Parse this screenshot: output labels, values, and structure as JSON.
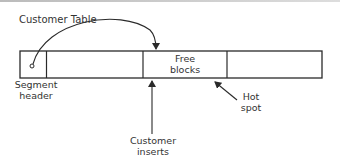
{
  "diagram": {
    "title": "Customer Table",
    "cells": [
      {
        "id": "segment-header",
        "label": "",
        "has_marker": true
      },
      {
        "id": "block-1",
        "label": ""
      },
      {
        "id": "free-blocks",
        "label_line1": "Free",
        "label_line2": "blocks"
      },
      {
        "id": "block-3",
        "label": ""
      }
    ],
    "labels": {
      "segment_header_line1": "Segment",
      "segment_header_line2": "header",
      "customer_inserts_line1": "Customer",
      "customer_inserts_line2": "inserts",
      "hot_spot_line1": "Hot",
      "hot_spot_line2": "spot"
    },
    "colors": {
      "line": "#2a2a2a",
      "background": "#ffffff"
    }
  }
}
